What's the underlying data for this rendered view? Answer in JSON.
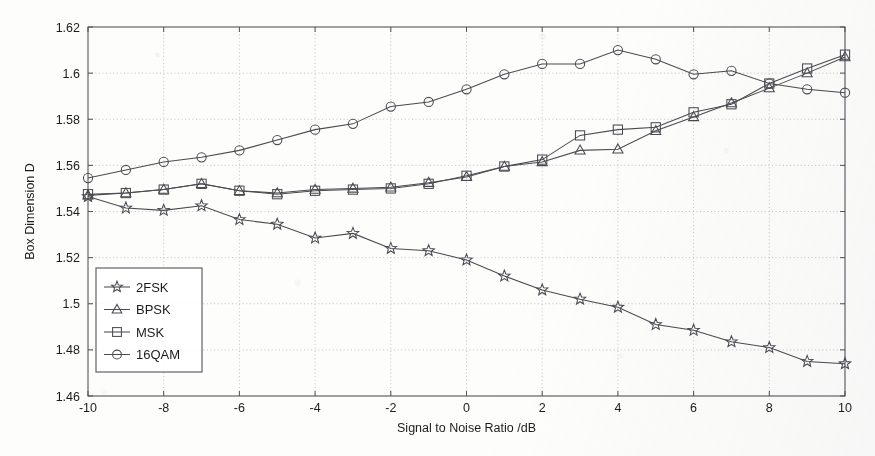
{
  "chart_data": {
    "type": "line",
    "title": "",
    "xlabel": "Signal to Noise Ratio /dB",
    "ylabel": "Box Dimension D",
    "xlim": [
      -10,
      10
    ],
    "ylim": [
      1.46,
      1.62
    ],
    "xticks": [
      -10,
      -8,
      -6,
      -4,
      -2,
      0,
      2,
      4,
      6,
      8,
      10
    ],
    "xtick_labels": [
      "-10",
      "-8",
      "-6",
      "-4",
      "-2",
      "0",
      "2",
      "4",
      "6",
      "8",
      "10"
    ],
    "yticks": [
      1.46,
      1.48,
      1.5,
      1.52,
      1.54,
      1.56,
      1.58,
      1.6,
      1.62
    ],
    "ytick_labels": [
      "1.46",
      "1.48",
      "1.5",
      "1.52",
      "1.54",
      "1.56",
      "1.58",
      "1.6",
      "1.62"
    ],
    "grid": true,
    "legend_position": "lower-left",
    "x": [
      -10,
      -9,
      -8,
      -7,
      -6,
      -5,
      -4,
      -3,
      -2,
      -1,
      0,
      1,
      2,
      3,
      4,
      5,
      6,
      7,
      8,
      9,
      10
    ],
    "series": [
      {
        "name": "2FSK",
        "marker": "star",
        "values": [
          1.5465,
          1.5415,
          1.5405,
          1.5425,
          1.5365,
          1.5345,
          1.5285,
          1.5305,
          1.524,
          1.523,
          1.519,
          1.512,
          1.506,
          1.502,
          1.4985,
          1.491,
          1.4885,
          1.4835,
          1.481,
          1.475,
          1.474
        ]
      },
      {
        "name": "BPSK",
        "marker": "triangle",
        "values": [
          1.547,
          1.548,
          1.5495,
          1.552,
          1.549,
          1.548,
          1.5495,
          1.55,
          1.5505,
          1.5525,
          1.555,
          1.5595,
          1.5615,
          1.5665,
          1.567,
          1.575,
          1.581,
          1.587,
          1.5935,
          1.6,
          1.607
        ]
      },
      {
        "name": "MSK",
        "marker": "square",
        "values": [
          1.5475,
          1.548,
          1.5495,
          1.552,
          1.549,
          1.5475,
          1.549,
          1.5495,
          1.55,
          1.552,
          1.5555,
          1.5595,
          1.5625,
          1.573,
          1.5755,
          1.5765,
          1.583,
          1.5865,
          1.5955,
          1.602,
          1.608
        ]
      },
      {
        "name": "16QAM",
        "marker": "circle",
        "values": [
          1.5545,
          1.558,
          1.5615,
          1.5635,
          1.5665,
          1.571,
          1.5755,
          1.578,
          1.5855,
          1.5875,
          1.593,
          1.5995,
          1.604,
          1.604,
          1.61,
          1.606,
          1.5995,
          1.601,
          1.5955,
          1.593,
          1.5915
        ]
      }
    ]
  },
  "legend": {
    "items": [
      {
        "label": "2FSK",
        "marker": "star-marker"
      },
      {
        "label": "BPSK",
        "marker": "triangle-marker"
      },
      {
        "label": "MSK",
        "marker": "square-marker"
      },
      {
        "label": "16QAM",
        "marker": "circle-marker"
      }
    ]
  }
}
